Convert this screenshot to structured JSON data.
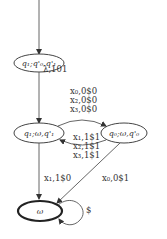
{
  "diagram": {
    "type": "state-transition-graph",
    "nodes": [
      {
        "id": "n1",
        "label": "q₁;q'₀,q'₁",
        "initial": true,
        "final": false
      },
      {
        "id": "n2",
        "label": "q₁;ω,q'₁",
        "initial": false,
        "final": false
      },
      {
        "id": "n3",
        "label": "q₀;ω,q'₀",
        "initial": false,
        "final": false
      },
      {
        "id": "n4",
        "label": "ω",
        "initial": false,
        "final": true
      }
    ],
    "edges": [
      {
        "from": "n1",
        "to": "n2",
        "label": "λ,1|0|1"
      },
      {
        "from": "n2",
        "to": "n3",
        "labels": [
          "x₀,0$0",
          "x₂,0$0",
          "x₃,0$0"
        ]
      },
      {
        "from": "n3",
        "to": "n2",
        "labels": [
          "x₁,1$1",
          "x₂,1$1",
          "x₃,1$1"
        ]
      },
      {
        "from": "n2",
        "to": "n4",
        "label": "x₁,1$0"
      },
      {
        "from": "n3",
        "to": "n4",
        "label": "x₀,0$1"
      },
      {
        "from": "n4",
        "to": "n4",
        "label": "$"
      }
    ]
  },
  "labels": {
    "n1": "q₁;q'₀,q'₁",
    "n2": "q₁;ω,q'₁",
    "n3": "q₀;ω,q'₀",
    "n4": "ω",
    "e12": "λ,101",
    "e23_1": "x₀,0$0",
    "e23_2": "x₂,0$0",
    "e23_3": "x₃,0$0",
    "e32_1": "x₁,1$1",
    "e32_2": "x₂,1$1",
    "e32_3": "x₃,1$1",
    "e24": "x₁,1$0",
    "e34": "x₀,0$1",
    "e44": "$"
  }
}
